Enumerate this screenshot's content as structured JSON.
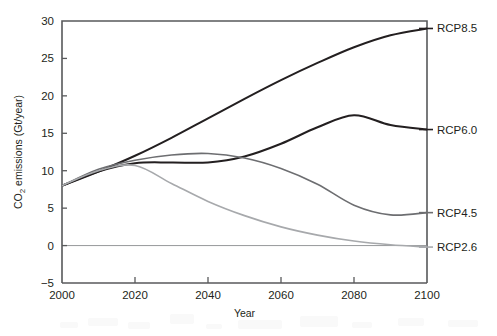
{
  "chart_data": {
    "type": "line",
    "title": "",
    "xlabel": "Year",
    "ylabel": "CO2 emissions (Gt/year)",
    "ylabel_parts": {
      "pre": "CO",
      "sub": "2",
      "post": " emissions (Gt/year)"
    },
    "xlim": [
      2000,
      2100
    ],
    "ylim": [
      -5,
      30
    ],
    "xticks": [
      2000,
      2020,
      2040,
      2060,
      2080,
      2100
    ],
    "xtick_labels": [
      "2000",
      "2020",
      "2040",
      "2060",
      "2080",
      "2100"
    ],
    "yticks": [
      -5,
      0,
      5,
      10,
      15,
      20,
      25,
      30
    ],
    "ytick_labels": [
      "−5",
      "0",
      "5",
      "10",
      "15",
      "20",
      "25",
      "30"
    ],
    "grid": false,
    "zero_line": true,
    "legend_position": "right-inline",
    "x": [
      2000,
      2010,
      2020,
      2030,
      2040,
      2050,
      2060,
      2070,
      2080,
      2090,
      2100
    ],
    "series": [
      {
        "name": "RCP8.5",
        "label": "RCP8.5",
        "color": "#231f20",
        "width": 2.0,
        "label_value": 29.0,
        "values": [
          8.0,
          9.9,
          12.0,
          14.4,
          17.0,
          19.6,
          22.1,
          24.4,
          26.5,
          28.1,
          29.0
        ]
      },
      {
        "name": "RCP6.0",
        "label": "RCP6.0",
        "color": "#231f20",
        "width": 2.0,
        "label_value": 15.5,
        "values": [
          8.0,
          9.9,
          11.0,
          11.1,
          11.1,
          11.9,
          13.6,
          15.8,
          17.4,
          16.1,
          15.5
        ]
      },
      {
        "name": "RCP4.5",
        "label": "RCP4.5",
        "color": "#6d6e71",
        "width": 1.6,
        "label_value": 4.4,
        "values": [
          8.0,
          10.2,
          11.4,
          12.1,
          12.3,
          11.7,
          10.3,
          8.2,
          5.4,
          4.1,
          4.4
        ]
      },
      {
        "name": "RCP2.6",
        "label": "RCP2.6",
        "color": "#a7a9ac",
        "width": 1.6,
        "label_value": -0.2,
        "values": [
          8.0,
          10.0,
          10.7,
          8.3,
          5.9,
          4.0,
          2.5,
          1.4,
          0.6,
          0.1,
          -0.2
        ]
      }
    ]
  },
  "plot_box": {
    "left": 62,
    "right": 427,
    "top": 21,
    "bottom": 283
  }
}
